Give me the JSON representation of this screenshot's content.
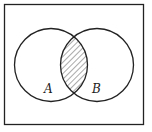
{
  "diagram": {
    "type": "venn",
    "universe": {
      "x": 4.5,
      "y": 4.5,
      "width": 139,
      "height": 120
    },
    "sets": [
      {
        "label": "A",
        "cx": 51,
        "cy": 65,
        "r": 36.5,
        "label_x": 48,
        "label_y": 93
      },
      {
        "label": "B",
        "cx": 97,
        "cy": 65,
        "r": 36.5,
        "label_x": 96,
        "label_y": 93
      }
    ],
    "shaded_region": "A ∩ B",
    "colors": {
      "stroke": "#222222",
      "hatch": "#555555",
      "background": "#ffffff"
    }
  }
}
